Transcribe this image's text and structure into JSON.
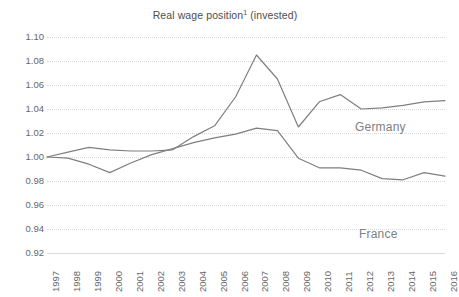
{
  "chart_data": {
    "type": "line",
    "title_main": "Real wage position",
    "title_footnote": "1",
    "title_suffix": " (invested)",
    "xlabel": "",
    "ylabel": "",
    "x": [
      1997,
      1998,
      1999,
      2000,
      2001,
      2002,
      2003,
      2004,
      2005,
      2006,
      2007,
      2008,
      2009,
      2010,
      2011,
      2012,
      2013,
      2014,
      2015,
      2016
    ],
    "categories": [
      "1997",
      "1998",
      "1999",
      "2000",
      "2001",
      "2002",
      "2003",
      "2004",
      "2005",
      "2006",
      "2007",
      "2008",
      "2009",
      "2010",
      "2011",
      "2012",
      "2013",
      "2014",
      "2015",
      "2016"
    ],
    "ylim": [
      0.92,
      1.1
    ],
    "yticks": [
      1.1,
      1.08,
      1.06,
      1.04,
      1.02,
      1.0,
      0.98,
      0.96,
      0.94,
      0.92
    ],
    "ytick_labels": [
      "1.10",
      "1.08",
      "1.06",
      "1.04",
      "1.02",
      "1.00",
      "0.98",
      "0.96",
      "0.94",
      "0.92"
    ],
    "grid": true,
    "grid_axis": "y",
    "legend_position": "inline-annotation",
    "series": [
      {
        "name": "Germany",
        "color": "#7f7f7f",
        "label_x": 2013,
        "values": [
          1.0,
          1.004,
          1.008,
          1.006,
          1.005,
          1.005,
          1.006,
          1.017,
          1.026,
          1.05,
          1.085,
          1.065,
          1.025,
          1.046,
          1.052,
          1.04,
          1.041,
          1.043,
          1.046,
          1.047
        ]
      },
      {
        "name": "France",
        "color": "#7f7f7f",
        "label_x": 2013,
        "values": [
          1.0,
          0.999,
          0.994,
          0.987,
          0.995,
          1.002,
          1.007,
          1.012,
          1.016,
          1.019,
          1.024,
          1.022,
          0.999,
          0.991,
          0.991,
          0.989,
          0.982,
          0.981,
          0.987,
          0.984
        ]
      }
    ]
  }
}
